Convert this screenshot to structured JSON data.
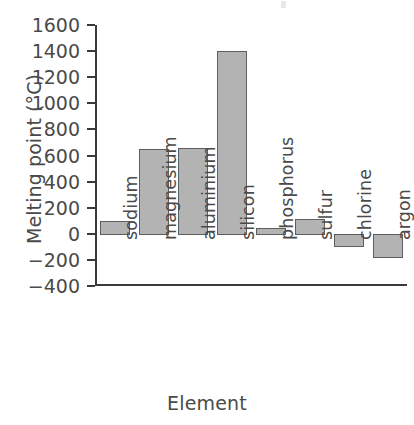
{
  "chart_data": {
    "type": "bar",
    "title": "",
    "xlabel": "Element",
    "ylabel": "Melting point (°C)",
    "categories": [
      "sodium",
      "magnesium",
      "aluminium",
      "silicon",
      "phosphorus",
      "sulfur",
      "chlorine",
      "argon"
    ],
    "values": [
      98,
      650,
      660,
      1400,
      44,
      115,
      -101,
      -189
    ],
    "ylim": [
      -400,
      1600
    ],
    "y_ticks": [
      1600,
      1400,
      1200,
      1000,
      800,
      600,
      400,
      200,
      0,
      -200,
      -400
    ],
    "y_tick_labels": [
      "1600",
      "1400",
      "1200",
      "1000",
      "800",
      "600",
      "400",
      "200",
      "0",
      "−200",
      "−400"
    ],
    "grid": false,
    "legend": "none",
    "bar_color": "#b3b3b3",
    "bar_border_color": "#5e5e5e",
    "axis_color": "#3a3a3a",
    "text_color": "#4a4a4a"
  }
}
